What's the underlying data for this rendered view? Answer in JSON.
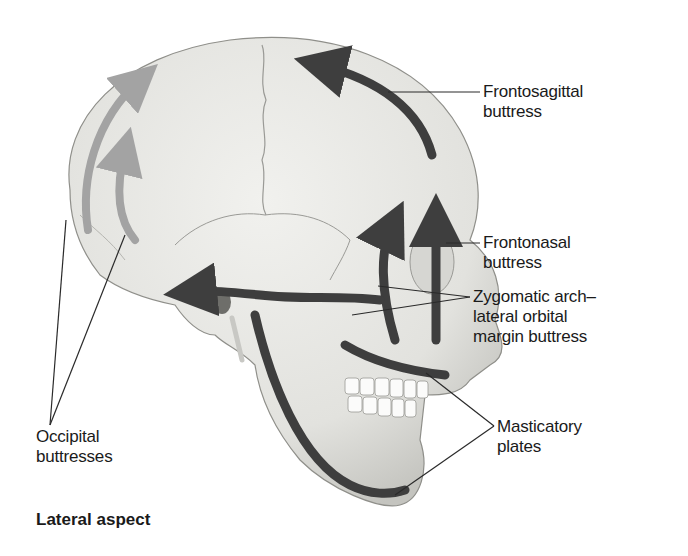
{
  "figure": {
    "caption": "Lateral aspect",
    "colors": {
      "bone": "#e9e9e6",
      "bone_shade": "#c9c9c5",
      "buttress_dark": "#3e3e3e",
      "buttress_light": "#a3a3a3",
      "leader_line": "#2a2a2a"
    }
  },
  "labels": {
    "frontosagittal": {
      "line1": "Frontosagittal",
      "line2": "buttress"
    },
    "frontonasal": {
      "line1": "Frontonasal",
      "line2": "buttress"
    },
    "zygomatic": {
      "line1": "Zygomatic arch–",
      "line2": "lateral orbital",
      "line3": "margin buttress"
    },
    "masticatory": {
      "line1": "Masticatory",
      "line2": "plates"
    },
    "occipital": {
      "line1": "Occipital",
      "line2": "buttresses"
    }
  }
}
